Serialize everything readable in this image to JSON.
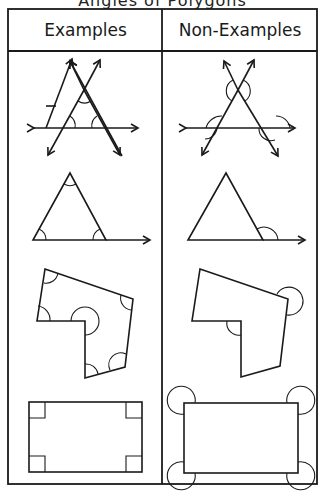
{
  "title_partial": "Angles of Polygons",
  "table": {
    "columns": [
      "Examples",
      "Non-Examples"
    ],
    "rows": [
      {
        "shape": "intersecting-lines-triangle",
        "example_marks": "interior angles",
        "non_example_marks": "exterior angles"
      },
      {
        "shape": "triangle-with-extended-side",
        "example_marks": "interior angles",
        "non_example_marks": "exterior angle"
      },
      {
        "shape": "concave-hexagon",
        "example_marks": "interior angles",
        "non_example_marks": "exterior angles"
      },
      {
        "shape": "rectangle",
        "example_marks": "right angles",
        "non_example_marks": "exterior angles"
      }
    ]
  },
  "colors": {
    "line": "#1a1a1a",
    "background": "#ffffff"
  }
}
